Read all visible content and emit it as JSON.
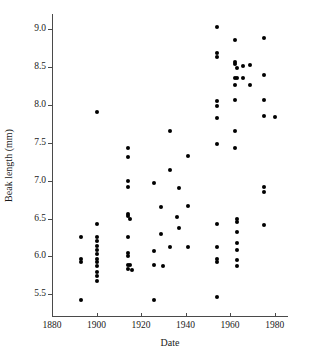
{
  "chart_data": {
    "type": "scatter",
    "title": "",
    "xlabel": "Date",
    "ylabel": "Beak length (mm)",
    "xlim": [
      1880,
      1986
    ],
    "ylim": [
      5.2,
      9.2
    ],
    "xticks": [
      1880,
      1900,
      1920,
      1940,
      1960,
      1980
    ],
    "xticklabels": [
      "1880",
      "1900",
      "1920",
      "1940",
      "1960",
      "1980"
    ],
    "yticks": [
      5.5,
      6.0,
      6.5,
      7.0,
      7.5,
      8.0,
      8.5,
      9.0
    ],
    "yticklabels": [
      "5.5",
      "6.0",
      "6.5",
      "7.0",
      "7.5",
      "8.0",
      "8.5",
      "9.0"
    ],
    "grid": false,
    "legend": null,
    "marker": "filled-circle",
    "marker_color": "#000000",
    "points": [
      {
        "x": 1893,
        "y": 6.26
      },
      {
        "x": 1893,
        "y": 5.97
      },
      {
        "x": 1893,
        "y": 5.92
      },
      {
        "x": 1893,
        "y": 5.43
      },
      {
        "x": 1900,
        "y": 7.9
      },
      {
        "x": 1900,
        "y": 6.43
      },
      {
        "x": 1900,
        "y": 6.26
      },
      {
        "x": 1900,
        "y": 6.2
      },
      {
        "x": 1900,
        "y": 6.14
      },
      {
        "x": 1900,
        "y": 6.08
      },
      {
        "x": 1900,
        "y": 6.03
      },
      {
        "x": 1900,
        "y": 5.97
      },
      {
        "x": 1900,
        "y": 5.93
      },
      {
        "x": 1900,
        "y": 5.87
      },
      {
        "x": 1900,
        "y": 5.8
      },
      {
        "x": 1900,
        "y": 5.74
      },
      {
        "x": 1900,
        "y": 5.68
      },
      {
        "x": 1914,
        "y": 7.43
      },
      {
        "x": 1914,
        "y": 7.31
      },
      {
        "x": 1914,
        "y": 6.99
      },
      {
        "x": 1914,
        "y": 6.92
      },
      {
        "x": 1914,
        "y": 6.56
      },
      {
        "x": 1914,
        "y": 6.53
      },
      {
        "x": 1914,
        "y": 6.26
      },
      {
        "x": 1914,
        "y": 6.05
      },
      {
        "x": 1914,
        "y": 6.0
      },
      {
        "x": 1914,
        "y": 5.88
      },
      {
        "x": 1914,
        "y": 5.84
      },
      {
        "x": 1915,
        "y": 6.5
      },
      {
        "x": 1915,
        "y": 5.89
      },
      {
        "x": 1916,
        "y": 5.82
      },
      {
        "x": 1926,
        "y": 6.97
      },
      {
        "x": 1926,
        "y": 6.07
      },
      {
        "x": 1926,
        "y": 5.88
      },
      {
        "x": 1926,
        "y": 5.42
      },
      {
        "x": 1929,
        "y": 6.65
      },
      {
        "x": 1929,
        "y": 6.29
      },
      {
        "x": 1930,
        "y": 5.87
      },
      {
        "x": 1933,
        "y": 7.65
      },
      {
        "x": 1933,
        "y": 7.14
      },
      {
        "x": 1933,
        "y": 6.13
      },
      {
        "x": 1936,
        "y": 6.52
      },
      {
        "x": 1937,
        "y": 6.9
      },
      {
        "x": 1937,
        "y": 6.38
      },
      {
        "x": 1941,
        "y": 7.33
      },
      {
        "x": 1941,
        "y": 6.67
      },
      {
        "x": 1941,
        "y": 6.13
      },
      {
        "x": 1954,
        "y": 9.03
      },
      {
        "x": 1954,
        "y": 8.68
      },
      {
        "x": 1954,
        "y": 8.63
      },
      {
        "x": 1954,
        "y": 8.05
      },
      {
        "x": 1954,
        "y": 7.99
      },
      {
        "x": 1954,
        "y": 7.83
      },
      {
        "x": 1954,
        "y": 7.49
      },
      {
        "x": 1954,
        "y": 6.43
      },
      {
        "x": 1954,
        "y": 6.12
      },
      {
        "x": 1954,
        "y": 5.97
      },
      {
        "x": 1954,
        "y": 5.92
      },
      {
        "x": 1954,
        "y": 5.46
      },
      {
        "x": 1962,
        "y": 8.86
      },
      {
        "x": 1962,
        "y": 8.56
      },
      {
        "x": 1962,
        "y": 8.54
      },
      {
        "x": 1962,
        "y": 8.35
      },
      {
        "x": 1962,
        "y": 8.26
      },
      {
        "x": 1962,
        "y": 8.07
      },
      {
        "x": 1962,
        "y": 7.65
      },
      {
        "x": 1962,
        "y": 7.43
      },
      {
        "x": 1963,
        "y": 8.49
      },
      {
        "x": 1963,
        "y": 8.36
      },
      {
        "x": 1963,
        "y": 6.5
      },
      {
        "x": 1963,
        "y": 6.46
      },
      {
        "x": 1963,
        "y": 6.32
      },
      {
        "x": 1963,
        "y": 6.18
      },
      {
        "x": 1963,
        "y": 6.08
      },
      {
        "x": 1963,
        "y": 5.95
      },
      {
        "x": 1963,
        "y": 5.87
      },
      {
        "x": 1966,
        "y": 8.51
      },
      {
        "x": 1966,
        "y": 8.36
      },
      {
        "x": 1969,
        "y": 8.53
      },
      {
        "x": 1969,
        "y": 8.26
      },
      {
        "x": 1975,
        "y": 8.88
      },
      {
        "x": 1975,
        "y": 8.4
      },
      {
        "x": 1975,
        "y": 8.06
      },
      {
        "x": 1975,
        "y": 7.86
      },
      {
        "x": 1975,
        "y": 6.92
      },
      {
        "x": 1975,
        "y": 6.85
      },
      {
        "x": 1975,
        "y": 6.42
      },
      {
        "x": 1980,
        "y": 7.84
      }
    ]
  }
}
